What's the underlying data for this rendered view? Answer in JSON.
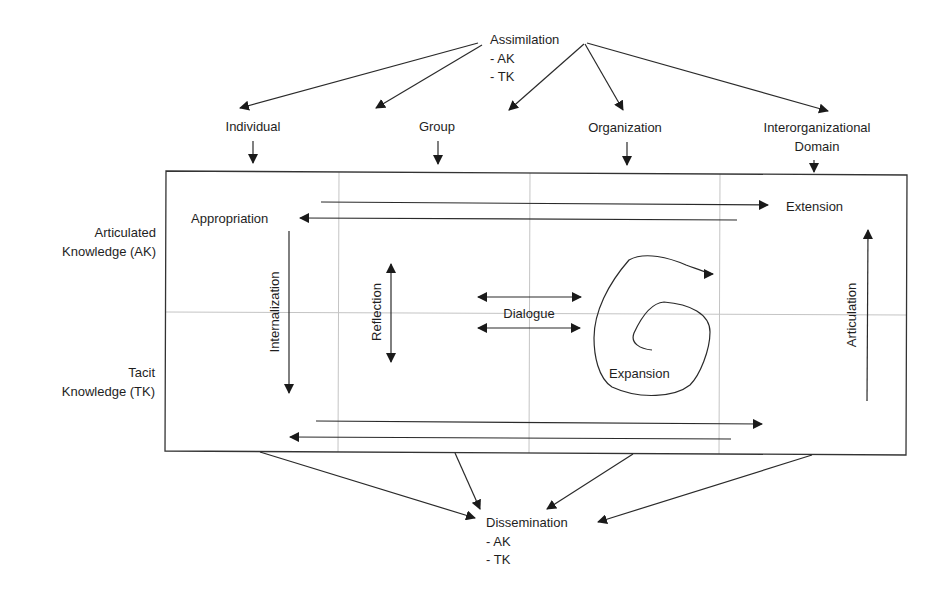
{
  "diagram": {
    "type": "knowledge-process-framework",
    "top_node": {
      "title": "Assimilation",
      "items": [
        "- AK",
        "- TK"
      ]
    },
    "bottom_node": {
      "title": "Dissemination",
      "items": [
        "- AK",
        "- TK"
      ]
    },
    "columns": [
      {
        "label": "Individual"
      },
      {
        "label": "Group"
      },
      {
        "label": "Organization"
      },
      {
        "label": "Interorganizational",
        "label2": "Domain"
      }
    ],
    "rows": [
      {
        "label": "Articulated",
        "label2": "Knowledge (AK)"
      },
      {
        "label": "Tacit",
        "label2": "Knowledge (TK)"
      }
    ],
    "processes": {
      "appropriation": "Appropriation",
      "extension": "Extension",
      "internalization": "Internalization",
      "reflection": "Reflection",
      "dialogue": "Dialogue",
      "expansion": "Expansion",
      "articulation": "Articulation"
    }
  }
}
